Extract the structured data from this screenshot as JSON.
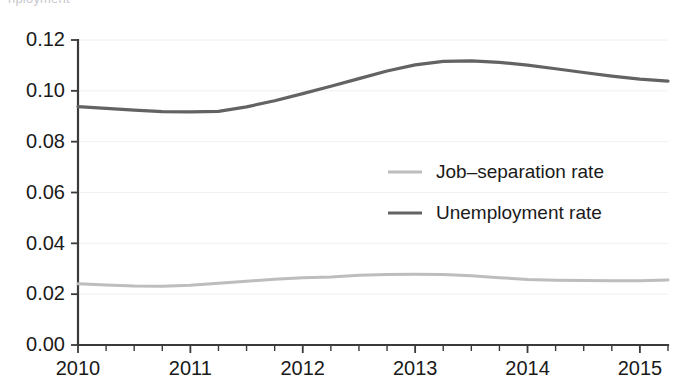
{
  "caption": {
    "clipped_top_text": "nployment"
  },
  "chart_data": {
    "type": "line",
    "title": "",
    "subtitle": "",
    "xlabel": "",
    "ylabel": "",
    "grid": true,
    "legend_position": "inside-right",
    "xlim": [
      2010.0,
      2015.25
    ],
    "ylim": [
      0.0,
      0.12
    ],
    "x_tick_labels": [
      "2010",
      "2011",
      "2012",
      "2013",
      "2014",
      "2015"
    ],
    "x_ticks": [
      2010,
      2011,
      2012,
      2013,
      2014,
      2015
    ],
    "x_minor_tick_step": 0.25,
    "y_ticks": [
      0.0,
      0.02,
      0.04,
      0.06,
      0.08,
      0.1,
      0.12
    ],
    "y_tick_labels": [
      "0.00",
      "0.02",
      "0.04",
      "0.06",
      "0.08",
      "0.10",
      "0.12"
    ],
    "x": [
      2010.0,
      2010.25,
      2010.5,
      2010.75,
      2011.0,
      2011.25,
      2011.5,
      2011.75,
      2012.0,
      2012.25,
      2012.5,
      2012.75,
      2013.0,
      2013.25,
      2013.5,
      2013.75,
      2014.0,
      2014.25,
      2014.5,
      2014.75,
      2015.0,
      2015.25
    ],
    "series": [
      {
        "name": "Job-separation rate",
        "legend_label": "Job–separation rate",
        "color": "#bdbdbd",
        "width": 3.0,
        "values": [
          0.0241,
          0.0236,
          0.0232,
          0.0231,
          0.0235,
          0.0243,
          0.0251,
          0.0259,
          0.0265,
          0.0268,
          0.0274,
          0.0277,
          0.0278,
          0.0277,
          0.0272,
          0.0265,
          0.0258,
          0.0255,
          0.0254,
          0.0253,
          0.0253,
          0.0256
        ]
      },
      {
        "name": "Unemployment rate",
        "legend_label": "Unemployment rate",
        "color": "#636363",
        "width": 3.2,
        "values": [
          0.0938,
          0.0931,
          0.0924,
          0.0918,
          0.0917,
          0.0919,
          0.0937,
          0.0961,
          0.0989,
          0.1018,
          0.1048,
          0.1078,
          0.1102,
          0.1116,
          0.1118,
          0.1112,
          0.1101,
          0.1087,
          0.1072,
          0.1058,
          0.1046,
          0.1038
        ]
      }
    ],
    "legend_entries": [
      {
        "label": "Job–separation rate",
        "color": "#bdbdbd"
      },
      {
        "label": "Unemployment rate",
        "color": "#636363"
      }
    ]
  },
  "colors": {
    "background": "#ffffff",
    "axis": "#3a3a3a",
    "grid": "#f0f0f0",
    "text": "#1a1a1a"
  }
}
